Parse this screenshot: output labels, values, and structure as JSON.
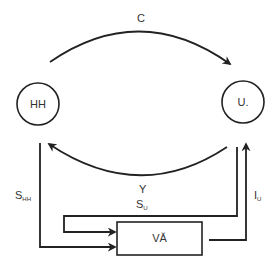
{
  "diagram": {
    "type": "circular-flow",
    "colors": {
      "stroke": "#222222",
      "text": "#333333",
      "background": "#ffffff"
    },
    "nodes": [
      {
        "id": "hh",
        "label": "HH",
        "shape": "circle"
      },
      {
        "id": "u",
        "label": "U.",
        "shape": "circle"
      },
      {
        "id": "va",
        "label": "VĂ",
        "shape": "rectangle"
      }
    ],
    "edges": [
      {
        "id": "c",
        "from": "hh",
        "to": "u",
        "label": "C"
      },
      {
        "id": "y",
        "from": "u",
        "to": "hh",
        "label": "Y"
      },
      {
        "id": "s_hh",
        "from": "hh",
        "to": "va",
        "label_main": "S",
        "label_sub": "HH"
      },
      {
        "id": "s_u",
        "from": "u",
        "to": "va",
        "label_main": "S",
        "label_sub": "U"
      },
      {
        "id": "i_u",
        "from": "va",
        "to": "u",
        "label_main": "I",
        "label_sub": "U"
      }
    ]
  }
}
